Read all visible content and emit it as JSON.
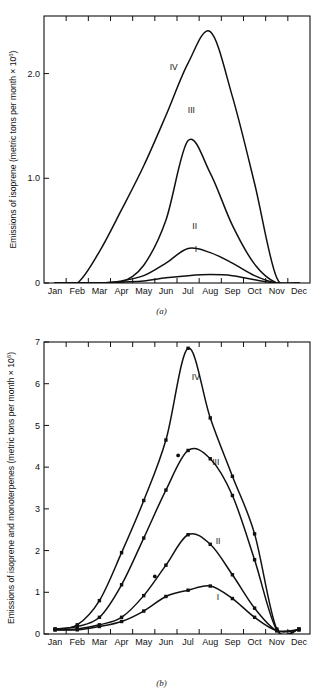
{
  "figure": {
    "panel_a_caption": "(a)",
    "panel_b_caption": "(b)"
  },
  "chart_data": [
    {
      "id": "panel-a",
      "type": "line",
      "title": "",
      "xlabel": "",
      "ylabel": "Emissions of isoprene (metric tons per month × 10⁶)",
      "ylabel_main": "Emissions of isoprene (metric tons per month × 10",
      "ylabel_exp": "6",
      "ylabel_tail": ")",
      "categories": [
        "Jan",
        "Feb",
        "Mar",
        "Apr",
        "May",
        "Jun",
        "Jul",
        "Aug",
        "Sep",
        "Oct",
        "Nov",
        "Dec"
      ],
      "ytick_labels": [
        "0",
        "1.0",
        "2.0"
      ],
      "ytick_values": [
        0,
        1.0,
        2.0
      ],
      "ylim": [
        0,
        2.55
      ],
      "grid": false,
      "legend": "inline curve labels",
      "markers": false,
      "series": [
        {
          "name": "I",
          "label": "I",
          "label_x": 6.35,
          "label_y": 0.3,
          "values": [
            0.0,
            0.0,
            0.0,
            0.01,
            0.02,
            0.05,
            0.07,
            0.08,
            0.07,
            0.03,
            0.0,
            0.0
          ]
        },
        {
          "name": "II",
          "label": "II",
          "label_x": 6.3,
          "label_y": 0.52,
          "values": [
            0.0,
            0.0,
            0.0,
            0.02,
            0.07,
            0.19,
            0.33,
            0.29,
            0.19,
            0.07,
            0.0,
            0.0
          ]
        },
        {
          "name": "III",
          "label": "III",
          "label_x": 6.15,
          "label_y": 1.62,
          "values": [
            0.0,
            0.0,
            0.0,
            0.01,
            0.17,
            0.6,
            1.36,
            1.05,
            0.55,
            0.18,
            0.0,
            0.0
          ]
        },
        {
          "name": "IV",
          "label": "IV",
          "label_x": 5.35,
          "label_y": 2.03,
          "values": [
            0.0,
            0.0,
            0.3,
            0.7,
            1.12,
            1.6,
            2.1,
            2.4,
            1.78,
            0.95,
            0.05,
            0.0
          ]
        }
      ]
    },
    {
      "id": "panel-b",
      "type": "line",
      "title": "",
      "xlabel": "",
      "ylabel": "Emissions of isoprene and monoterpenes (metric tons per month × 10⁶)",
      "ylabel_main": "Emissions of isoprene and monoterpenes (metric tons per month × 10",
      "ylabel_exp": "6",
      "ylabel_tail": ")",
      "categories": [
        "Jan",
        "Feb",
        "Mar",
        "Apr",
        "May",
        "Jun",
        "Jul",
        "Aug",
        "Sep",
        "Oct",
        "Nov",
        "Dec"
      ],
      "ytick_labels": [
        "0",
        "1",
        "2",
        "3",
        "4",
        "5",
        "6",
        "7"
      ],
      "ytick_values": [
        0,
        1,
        2,
        3,
        4,
        5,
        6,
        7
      ],
      "ylim": [
        0,
        7
      ],
      "grid": false,
      "legend": "inline curve labels",
      "markers": true,
      "series": [
        {
          "name": "I",
          "label": "I",
          "label_x": 7.35,
          "label_y": 0.82,
          "values": [
            0.1,
            0.1,
            0.18,
            0.3,
            0.55,
            0.9,
            1.05,
            1.15,
            0.85,
            0.4,
            0.08,
            0.1
          ]
        },
        {
          "name": "II",
          "label": "II",
          "label_x": 7.35,
          "label_y": 2.15,
          "values": [
            0.1,
            0.12,
            0.22,
            0.4,
            0.92,
            1.65,
            2.38,
            2.15,
            1.42,
            0.62,
            0.08,
            0.1
          ]
        },
        {
          "name": "III",
          "label": "III",
          "label_x": 7.25,
          "label_y": 4.05,
          "values": [
            0.12,
            0.18,
            0.4,
            1.18,
            2.3,
            3.45,
            4.4,
            4.2,
            3.32,
            1.78,
            0.1,
            0.12
          ]
        },
        {
          "name": "IV",
          "label": "IV",
          "label_x": 6.35,
          "label_y": 6.1,
          "values": [
            0.12,
            0.22,
            0.8,
            1.95,
            3.2,
            4.65,
            6.85,
            5.18,
            3.78,
            2.4,
            0.12,
            0.12
          ]
        }
      ],
      "outliers": [
        {
          "x": 4.5,
          "y": 1.38
        },
        {
          "x": 5.55,
          "y": 4.28
        }
      ]
    }
  ]
}
